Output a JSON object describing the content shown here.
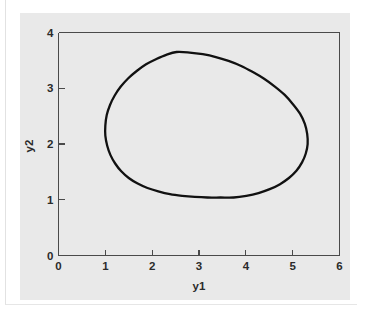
{
  "figure": {
    "clipped_caption": "",
    "panel_color": "#e9e9e9",
    "background_color": "#ffffff",
    "curve_color": "#111111",
    "axis_color": "#4a4a4a"
  },
  "chart_data": {
    "type": "line",
    "title": "",
    "xlabel": "y1",
    "ylabel": "y2",
    "xlim": [
      0,
      6
    ],
    "ylim": [
      0,
      4
    ],
    "xticks": [
      0,
      1,
      2,
      3,
      4,
      5,
      6
    ],
    "yticks": [
      0,
      1,
      2,
      3,
      4
    ],
    "xtick_labels": [
      "0",
      "1",
      "2",
      "3",
      "4",
      "5",
      "6"
    ],
    "ytick_labels": [
      "0",
      "1",
      "2",
      "3",
      "4"
    ],
    "grid": false,
    "legend": null,
    "series": [
      {
        "name": "limit cycle",
        "closed": true,
        "x_range": [
          1.0,
          5.32
        ],
        "y_range": [
          1.04,
          3.65
        ],
        "points": [
          [
            2.52,
            3.65
          ],
          [
            2.8,
            3.64
          ],
          [
            3.08,
            3.61
          ],
          [
            3.36,
            3.56
          ],
          [
            3.63,
            3.49
          ],
          [
            3.9,
            3.4
          ],
          [
            4.15,
            3.29
          ],
          [
            4.39,
            3.17
          ],
          [
            4.62,
            3.03
          ],
          [
            4.83,
            2.88
          ],
          [
            5.01,
            2.71
          ],
          [
            5.16,
            2.54
          ],
          [
            5.26,
            2.36
          ],
          [
            5.31,
            2.18
          ],
          [
            5.32,
            2.0
          ],
          [
            5.28,
            1.83
          ],
          [
            5.2,
            1.67
          ],
          [
            5.08,
            1.52
          ],
          [
            4.92,
            1.39
          ],
          [
            4.73,
            1.28
          ],
          [
            4.51,
            1.19
          ],
          [
            4.27,
            1.12
          ],
          [
            4.01,
            1.07
          ],
          [
            3.74,
            1.04
          ],
          [
            3.46,
            1.04
          ],
          [
            3.18,
            1.04
          ],
          [
            2.91,
            1.05
          ],
          [
            2.64,
            1.07
          ],
          [
            2.38,
            1.1
          ],
          [
            2.13,
            1.15
          ],
          [
            1.9,
            1.21
          ],
          [
            1.69,
            1.29
          ],
          [
            1.5,
            1.39
          ],
          [
            1.34,
            1.51
          ],
          [
            1.21,
            1.65
          ],
          [
            1.11,
            1.8
          ],
          [
            1.04,
            1.97
          ],
          [
            1.0,
            2.15
          ],
          [
            1.0,
            2.33
          ],
          [
            1.03,
            2.52
          ],
          [
            1.1,
            2.7
          ],
          [
            1.2,
            2.87
          ],
          [
            1.33,
            3.03
          ],
          [
            1.49,
            3.18
          ],
          [
            1.67,
            3.31
          ],
          [
            1.87,
            3.43
          ],
          [
            2.08,
            3.52
          ],
          [
            2.3,
            3.6
          ],
          [
            2.52,
            3.65
          ]
        ]
      }
    ]
  }
}
